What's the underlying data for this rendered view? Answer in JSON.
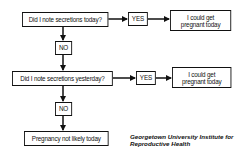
{
  "flowchart": {
    "question_today": "Did I note secretions today?",
    "yes_today": "YES",
    "result_today_line1": "I could get",
    "result_today_line2": "pregnant today",
    "no_today": "NO",
    "question_yesterday": "Did I note secretions yesterday?",
    "yes_yesterday": "YES",
    "result_yesterday_line1": "I could get",
    "result_yesterday_line2": "pregnant today",
    "no_yesterday": "NO",
    "final_result": "Pregnancy not likely today"
  },
  "caption": {
    "line1": "Georgetown University Institute for",
    "line2": "Reproductive Health"
  },
  "colors": {
    "line": "#111111",
    "background": "#ffffff"
  }
}
